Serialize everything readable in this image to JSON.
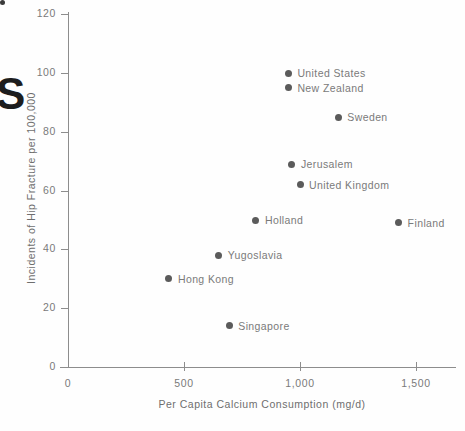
{
  "chart_data": {
    "type": "scatter",
    "title": "",
    "xlabel": "Per Capita Calcium Consumption (mg/d)",
    "ylabel": "Incidents of Hip Fracture per 100,000",
    "xlim": [
      0,
      1670
    ],
    "ylim": [
      0,
      120
    ],
    "grid": false,
    "legend": "none (points labeled inline)",
    "xticks": [
      {
        "value": 0,
        "label": "0"
      },
      {
        "value": 500,
        "label": "500"
      },
      {
        "value": 1000,
        "label": "1,000"
      },
      {
        "value": 1500,
        "label": "1,500"
      }
    ],
    "yticks": [
      {
        "value": 0,
        "label": "0"
      },
      {
        "value": 20,
        "label": "20"
      },
      {
        "value": 40,
        "label": "40"
      },
      {
        "value": 60,
        "label": "60"
      },
      {
        "value": 80,
        "label": "80"
      },
      {
        "value": 100,
        "label": "100"
      },
      {
        "value": 120,
        "label": "120"
      }
    ],
    "points": [
      {
        "label": "United States",
        "x": 950,
        "y": 100
      },
      {
        "label": "New Zealand",
        "x": 950,
        "y": 95
      },
      {
        "label": "Sweden",
        "x": 1165,
        "y": 85
      },
      {
        "label": "Jerusalem",
        "x": 965,
        "y": 69
      },
      {
        "label": "United Kingdom",
        "x": 1000,
        "y": 62
      },
      {
        "label": "Holland",
        "x": 810,
        "y": 50
      },
      {
        "label": "Finland",
        "x": 1425,
        "y": 49
      },
      {
        "label": "Yugoslavia",
        "x": 650,
        "y": 38
      },
      {
        "label": "Hong Kong",
        "x": 435,
        "y": 30
      },
      {
        "label": "Singapore",
        "x": 695,
        "y": 14
      }
    ],
    "point_color": "#5b5b5b",
    "axis_color": "#8d8d8d",
    "text_color": "#7a7a7a",
    "background_color": "#fefefe"
  },
  "artifacts": {
    "bleed_letter": "S"
  }
}
